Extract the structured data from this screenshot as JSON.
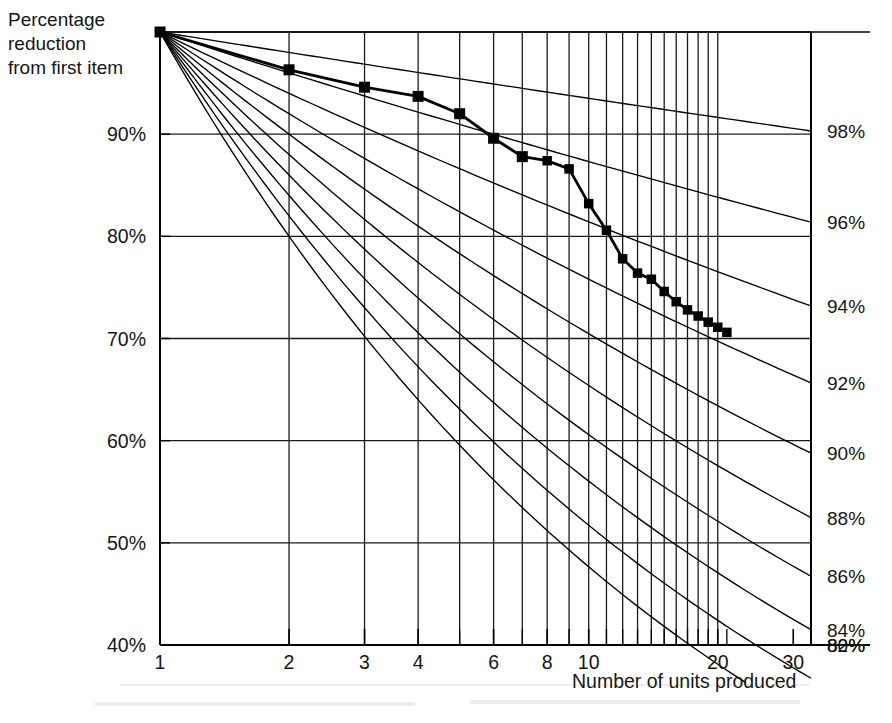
{
  "chart_data": {
    "type": "line",
    "title": "Percentage reduction from first item",
    "title_lines": [
      "Percentage",
      "reduction",
      "from first item"
    ],
    "xlabel": "Number of units produced",
    "ylabel": "Percentage reduction from first item",
    "xscale": "log",
    "xlim": [
      1,
      33
    ],
    "ylim": [
      40,
      100
    ],
    "grid": true,
    "legend_position": "right-axis-labels",
    "x_tick_labels": [
      "1",
      "2",
      "3",
      "4",
      "6",
      "8",
      "10",
      "20",
      "30"
    ],
    "x_tick_values": [
      1,
      2,
      3,
      4,
      6,
      8,
      10,
      20,
      30
    ],
    "x_minor_ticks": [
      5,
      7,
      9,
      11,
      12,
      13,
      14,
      15,
      16,
      17,
      18,
      19,
      21
    ],
    "y_tick_labels": [
      "40%",
      "50%",
      "60%",
      "70%",
      "80%",
      "90%"
    ],
    "y_tick_values": [
      40,
      50,
      60,
      70,
      80,
      90
    ],
    "y_gridlines": [
      50,
      60,
      70,
      80,
      90,
      100
    ],
    "x_gridlines": [
      2,
      3,
      4,
      5,
      6,
      7,
      8,
      9,
      10,
      11,
      12,
      13,
      14,
      15,
      16,
      17,
      18,
      19,
      20
    ],
    "reference_curves_label": "Learning curve rates",
    "reference_curves": [
      {
        "label": "98%",
        "rate": 98
      },
      {
        "label": "96%",
        "rate": 96
      },
      {
        "label": "94%",
        "rate": 94
      },
      {
        "label": "92%",
        "rate": 92
      },
      {
        "label": "90%",
        "rate": 90
      },
      {
        "label": "88%",
        "rate": 88
      },
      {
        "label": "86%",
        "rate": 86
      },
      {
        "label": "84%",
        "rate": 84
      },
      {
        "label": "82%",
        "rate": 82
      },
      {
        "label": "80%",
        "rate": 80
      }
    ],
    "series": [
      {
        "name": "Observed reduction",
        "marker": "square",
        "color": "#000000",
        "x": [
          1,
          2,
          3,
          4,
          5,
          6,
          7,
          8,
          9,
          10,
          11,
          12,
          13,
          14,
          15,
          16,
          17,
          18,
          19,
          20,
          21
        ],
        "values": [
          100.0,
          96.3,
          94.6,
          93.7,
          92.0,
          89.6,
          87.8,
          87.4,
          86.6,
          83.2,
          80.6,
          77.8,
          76.4,
          75.8,
          74.6,
          73.6,
          72.8,
          72.2,
          71.6,
          71.1,
          70.6
        ]
      }
    ]
  },
  "axes": {
    "y_axis_name": "percentage-reduction-axis",
    "x_axis_name": "units-produced-axis",
    "right_axis_name": "learning-curve-rate-axis"
  },
  "colors": {
    "ink": "#151515",
    "line": "#000000",
    "grid": "#1a1a1a",
    "background": "#ffffff"
  }
}
